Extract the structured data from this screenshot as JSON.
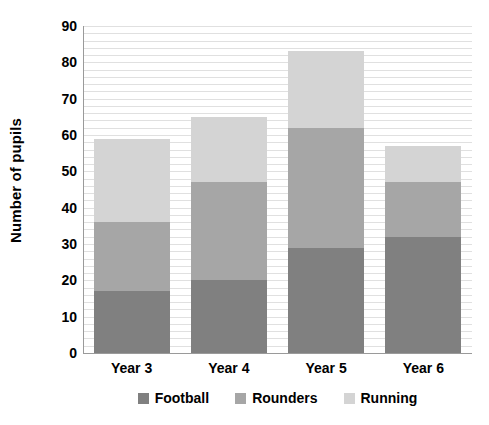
{
  "chart_data": {
    "type": "bar",
    "stacked": true,
    "title": "",
    "xlabel": "",
    "ylabel": "Number of pupils",
    "categories": [
      "Year 3",
      "Year 4",
      "Year 5",
      "Year 6"
    ],
    "series": [
      {
        "name": "Football",
        "color": "#808080",
        "values": [
          17,
          20,
          29,
          32
        ]
      },
      {
        "name": "Rounders",
        "color": "#a6a6a6",
        "values": [
          19,
          27,
          33,
          15
        ]
      },
      {
        "name": "Running",
        "color": "#d4d4d4",
        "values": [
          23,
          18,
          21,
          10
        ]
      }
    ],
    "totals": [
      59,
      65,
      83,
      57
    ],
    "ylim": [
      0,
      90
    ],
    "y_major_step": 10,
    "y_minor_step": 2,
    "y_tick_labels": [
      "90",
      "80",
      "70",
      "60",
      "50",
      "40",
      "30",
      "20",
      "10",
      "0"
    ],
    "grid": true,
    "grid_color": "#e0e0e0",
    "legend_position": "bottom"
  },
  "axis": {
    "y_title": "Number of pupils"
  },
  "legend": {
    "items": [
      {
        "label": "Football",
        "color": "#808080"
      },
      {
        "label": "Rounders",
        "color": "#a6a6a6"
      },
      {
        "label": "Running",
        "color": "#d4d4d4"
      }
    ]
  }
}
